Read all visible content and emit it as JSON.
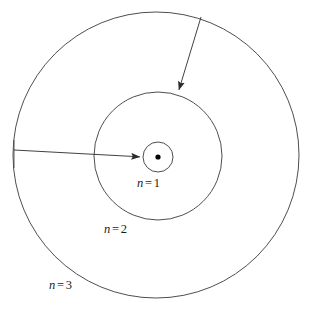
{
  "figure": {
    "background_color": "#ffffff",
    "stroke_color": "#3a3a3a",
    "nucleus_color": "#000000",
    "width": 309,
    "height": 312
  },
  "nucleus": {
    "name": "nucleus-dot",
    "cx": 158,
    "cy": 157,
    "r": 2.6
  },
  "shells": [
    {
      "id": "n1",
      "label_var": "n",
      "label_eq": "=",
      "label_num": "1",
      "label_text": "n = 1",
      "cx": 158,
      "cy": 157,
      "r": 15
    },
    {
      "id": "n2",
      "label_var": "n",
      "label_eq": "=",
      "label_num": "2",
      "label_text": "n = 2",
      "cx": 158,
      "cy": 156,
      "r": 64
    },
    {
      "id": "n3",
      "label_var": "n",
      "label_eq": "=",
      "label_num": "3",
      "label_text": "n = 3",
      "cx": 156,
      "cy": 155,
      "r": 143
    }
  ],
  "arrows": [
    {
      "id": "radius-arrow-horizontal",
      "description": "arrow from outer shell to innermost shell",
      "x1": 14,
      "y1": 150,
      "x2": 143,
      "y2": 157
    },
    {
      "id": "radius-arrow-diagonal",
      "description": "arrow from outer shell down to middle shell",
      "x1": 201,
      "y1": 17,
      "x2": 178,
      "y2": 93
    }
  ]
}
